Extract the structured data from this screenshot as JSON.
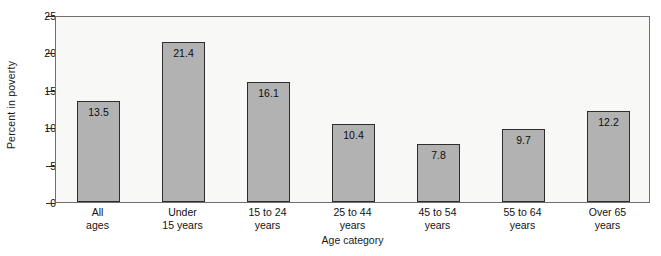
{
  "chart_data": {
    "type": "bar",
    "title": "",
    "xlabel": "Age category",
    "ylabel": "Percent in poverty",
    "categories": [
      "All ages",
      "Under 15 years",
      "15 to 24 years",
      "25 to 44 years",
      "45 to 54 years",
      "55 to 64 years",
      "Over 65 years"
    ],
    "category_lines": [
      {
        "line1": "All",
        "line2": "ages"
      },
      {
        "line1": "Under",
        "line2": "15 years"
      },
      {
        "line1": "15 to 24",
        "line2": "years"
      },
      {
        "line1": "25 to 44",
        "line2": "years"
      },
      {
        "line1": "45 to 54",
        "line2": "years"
      },
      {
        "line1": "55 to 64",
        "line2": "years"
      },
      {
        "line1": "Over 65",
        "line2": "years"
      }
    ],
    "values": [
      13.5,
      21.4,
      16.1,
      10.4,
      7.8,
      9.7,
      12.2
    ],
    "value_labels": [
      "13.5",
      "21.4",
      "16.1",
      "10.4",
      "7.8",
      "9.7",
      "12.2"
    ],
    "ylim": [
      0,
      25
    ],
    "yticks": [
      0,
      5,
      10,
      15,
      20,
      25
    ],
    "ytick_labels": [
      "0",
      "5",
      "10",
      "15",
      "20",
      "25"
    ],
    "grid": false,
    "legend": "none",
    "bar_color": "#b2b2b2",
    "bar_edge_color": "#2e2e2e",
    "plot_background": "#f8f8f7",
    "axis_color": "#6e6e6e"
  }
}
